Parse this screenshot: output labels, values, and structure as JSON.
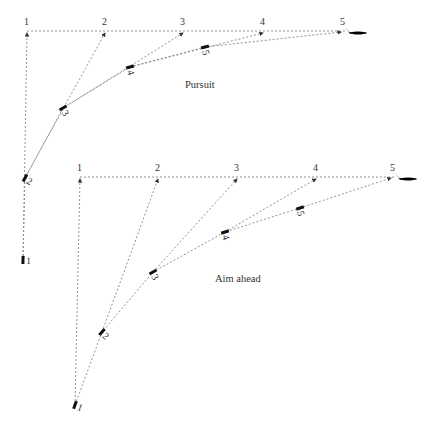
{
  "diagrams": [
    {
      "id": "pursuit",
      "label": "Pursuit",
      "label_pos": [
        185,
        88
      ],
      "target_path_y": 31,
      "target_points": [
        {
          "n": "1",
          "x": 27,
          "y": 31
        },
        {
          "n": "2",
          "x": 105,
          "y": 31
        },
        {
          "n": "3",
          "x": 183,
          "y": 31
        },
        {
          "n": "4",
          "x": 263,
          "y": 31
        },
        {
          "n": "5",
          "x": 345,
          "y": 31
        }
      ],
      "pursuer_points": [
        {
          "n": "1",
          "x": 23,
          "y": 260
        },
        {
          "n": "2",
          "x": 25,
          "y": 178
        },
        {
          "n": "3",
          "x": 63,
          "y": 108
        },
        {
          "n": "4",
          "x": 130,
          "y": 67
        },
        {
          "n": "5",
          "x": 205,
          "y": 47
        }
      ]
    },
    {
      "id": "aim-ahead",
      "label": "Aim ahead",
      "label_pos": [
        215,
        282
      ],
      "target_path_y": 177,
      "target_points": [
        {
          "n": "1",
          "x": 80,
          "y": 177
        },
        {
          "n": "2",
          "x": 158,
          "y": 177
        },
        {
          "n": "3",
          "x": 237,
          "y": 177
        },
        {
          "n": "4",
          "x": 316,
          "y": 177
        },
        {
          "n": "5",
          "x": 395,
          "y": 177
        }
      ],
      "pursuer_points": [
        {
          "n": "1",
          "x": 75,
          "y": 405
        },
        {
          "n": "2",
          "x": 102,
          "y": 332
        },
        {
          "n": "3",
          "x": 153,
          "y": 272
        },
        {
          "n": "4",
          "x": 225,
          "y": 232
        },
        {
          "n": "5",
          "x": 300,
          "y": 208
        }
      ]
    }
  ],
  "colors": {
    "line": "#888888",
    "text": "#333333",
    "icon": "#222222"
  },
  "caption": ""
}
